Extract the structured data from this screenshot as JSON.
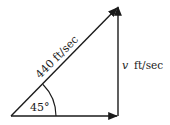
{
  "diagram": {
    "type": "vector-triangle",
    "hypotenuse": {
      "label": "440 ft/sec"
    },
    "vertical": {
      "label_var": "v",
      "label_unit": "ft/sec"
    },
    "angle": {
      "label": "45°"
    },
    "colors": {
      "stroke": "#1a1a1a",
      "background": "#ffffff"
    }
  }
}
